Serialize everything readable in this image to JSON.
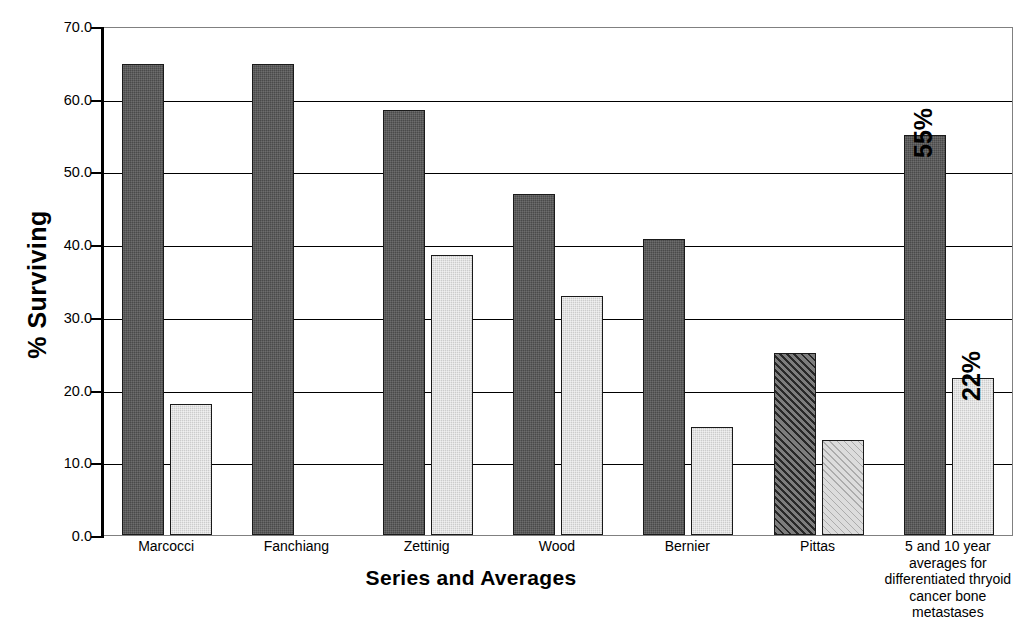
{
  "chart_data": {
    "type": "bar",
    "title": "",
    "xlabel": "Series and Averages",
    "ylabel": "% Surviving",
    "ylim": [
      0.0,
      70.0
    ],
    "ytick_labels": [
      "70.0",
      "60.0",
      "50.0",
      "40.0",
      "30.0",
      "20.0",
      "10.0",
      "0.0"
    ],
    "ytick_values": [
      70.0,
      60.0,
      50.0,
      40.0,
      30.0,
      20.0,
      10.0,
      0.0
    ],
    "grid": true,
    "legend": "none",
    "categories": [
      "Marcocci",
      "Fanchiang",
      "Zettinig",
      "Wood",
      "Bernier",
      "Pittas",
      "5 and 10 year\naverages  for\ndifferentiated thryoid\ncancer bone\nmetastases"
    ],
    "series": [
      {
        "name": "5 year survival",
        "style": "dark",
        "values": [
          64.8,
          64.8,
          58.4,
          46.9,
          40.7,
          25.0,
          55.0
        ]
      },
      {
        "name": "10 year survival",
        "style": "light",
        "values": [
          18.0,
          null,
          38.5,
          32.9,
          14.8,
          13.0,
          21.6
        ]
      }
    ],
    "annotations": [
      {
        "text": "55%",
        "category_index": 6,
        "series_index": 0,
        "rotation": -90
      },
      {
        "text": "22%",
        "category_index": 6,
        "series_index": 1,
        "rotation": -90
      }
    ],
    "colors": {
      "dark_bar": "#4a4a4a",
      "light_bar": "#cccccc",
      "dark_hatch_bar": "#585858",
      "light_hatch_bar": "#dcdcdc",
      "axis": "#000000",
      "gridline": "#000000",
      "frame": "#808080",
      "background": "#ffffff",
      "text": "#000000"
    }
  }
}
